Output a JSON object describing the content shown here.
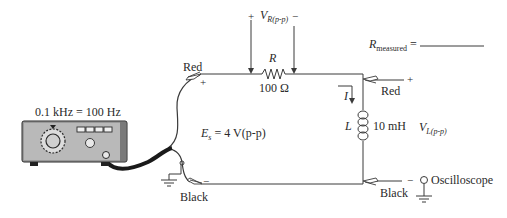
{
  "diagram": {
    "generator": {
      "frequency_label": "0.1 kHz = 100 Hz"
    },
    "source": {
      "symbol": "E",
      "subscript": "s",
      "value": "= 4 V(p-p)"
    },
    "resistor": {
      "symbol": "R",
      "value": "100 Ω"
    },
    "vr_measurement": {
      "plus": "+",
      "symbol": "V",
      "subscript": "R(p-p)",
      "minus": "−"
    },
    "inductor": {
      "symbol": "L",
      "value": "10 mH"
    },
    "vl_measurement": {
      "symbol": "V",
      "subscript": "L(p-p)"
    },
    "current": {
      "symbol": "I"
    },
    "r_measured": {
      "symbol": "R",
      "subscript": "measured",
      "equals": "="
    },
    "generator_leads": {
      "red_label": "Red",
      "red_polarity": "+",
      "black_label": "Black",
      "black_polarity": "−"
    },
    "scope_leads": {
      "red_label": "Red",
      "red_polarity": "+",
      "black_label": "Black",
      "black_polarity": "−",
      "scope_label": "Oscilloscope"
    }
  }
}
